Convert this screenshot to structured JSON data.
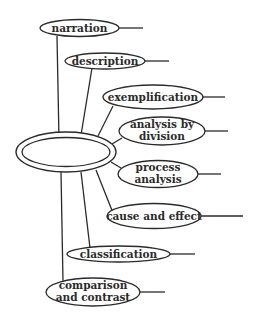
{
  "diagram": {
    "center": {
      "label": ""
    },
    "nodes": [
      {
        "id": "narration",
        "lines": [
          "narration"
        ]
      },
      {
        "id": "description",
        "lines": [
          "description"
        ]
      },
      {
        "id": "exemplification",
        "lines": [
          "exemplification"
        ]
      },
      {
        "id": "analysis-by-division",
        "lines": [
          "analysis by",
          "division"
        ]
      },
      {
        "id": "process-analysis",
        "lines": [
          "process",
          "analysis"
        ]
      },
      {
        "id": "cause-and-effect",
        "lines": [
          "cause and effect"
        ]
      },
      {
        "id": "classification",
        "lines": [
          "classification"
        ]
      },
      {
        "id": "comparison-and-contrast",
        "lines": [
          "comparison",
          "and contrast"
        ]
      }
    ]
  }
}
